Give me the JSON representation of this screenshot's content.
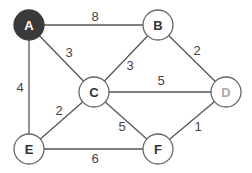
{
  "graph": {
    "nodes": [
      {
        "id": "A",
        "label": "A",
        "style": "dark"
      },
      {
        "id": "B",
        "label": "B",
        "style": "normal"
      },
      {
        "id": "C",
        "label": "C",
        "style": "normal"
      },
      {
        "id": "D",
        "label": "D",
        "style": "gray"
      },
      {
        "id": "E",
        "label": "E",
        "style": "normal"
      },
      {
        "id": "F",
        "label": "F",
        "style": "normal"
      }
    ],
    "edges": [
      {
        "from": "A",
        "to": "B",
        "weight": "8"
      },
      {
        "from": "A",
        "to": "C",
        "weight": "3"
      },
      {
        "from": "A",
        "to": "E",
        "weight": "4"
      },
      {
        "from": "B",
        "to": "C",
        "weight": "3"
      },
      {
        "from": "B",
        "to": "D",
        "weight": "2"
      },
      {
        "from": "C",
        "to": "D",
        "weight": "5"
      },
      {
        "from": "C",
        "to": "E",
        "weight": "2"
      },
      {
        "from": "C",
        "to": "F",
        "weight": "5"
      },
      {
        "from": "D",
        "to": "F",
        "weight": "1"
      },
      {
        "from": "E",
        "to": "F",
        "weight": "6"
      }
    ]
  }
}
